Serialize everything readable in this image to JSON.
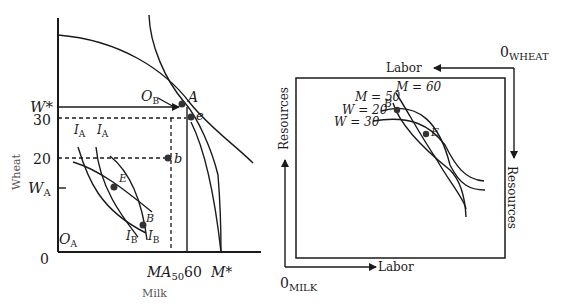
{
  "left_diagram": {
    "x_axis_title": "Milk",
    "y_axis_title": "Wheat",
    "y_ticks": {
      "w_star": "W*",
      "thirty": "30",
      "twenty": "20",
      "w_a": "W",
      "w_a_sub": "A",
      "zero": "0"
    },
    "x_ticks": {
      "ma": "MA",
      "ma_sub": "50",
      "sixty": "60",
      "m_star": "M*"
    },
    "origin_a": {
      "main": "O",
      "sub": "A"
    },
    "origin_b": {
      "main": "O",
      "sub": "B"
    },
    "points": {
      "A": "A",
      "e": "e",
      "b": "b",
      "E": "E",
      "B": "B"
    },
    "curves": {
      "ia1": "I",
      "ia2": "I",
      "ib1": "I",
      "ib2": "I",
      "sub_a": "A",
      "sub_b": "B"
    }
  },
  "right_diagram": {
    "origin_wheat": {
      "main": "0",
      "sub": "WHEAT"
    },
    "origin_milk": {
      "main": "0",
      "sub": "MILK"
    },
    "labor_top": "Labor",
    "labor_bottom": "Labor",
    "resources_left": "Resources",
    "resources_right": "Resources",
    "isoquants": {
      "m60": "M = 60",
      "m50": "M = 50",
      "w20": "W = 20",
      "w30": "W = 30"
    },
    "points": {
      "B": "B",
      "E": "E"
    }
  }
}
